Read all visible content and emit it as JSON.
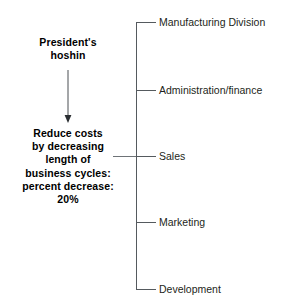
{
  "diagram": {
    "type": "tree-deployment-chart",
    "line_color": "#555a5e",
    "text_color": "#000000",
    "background": "#ffffff",
    "left_column": {
      "title": "President's\nhoshin",
      "arrow": "down-arrow",
      "goal": "Reduce costs\nby decreasing\nlength of\nbusiness cycles:\npercent decrease:\n20%"
    },
    "branches": [
      {
        "label": "Manufacturing Division",
        "y": 22
      },
      {
        "label": "Administration/finance",
        "y": 90
      },
      {
        "label": "Sales",
        "y": 156
      },
      {
        "label": "Marketing",
        "y": 222
      },
      {
        "label": "Development",
        "y": 289
      }
    ]
  }
}
